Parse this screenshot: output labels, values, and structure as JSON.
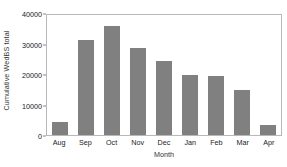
{
  "chart_data": {
    "type": "bar",
    "title": "",
    "xlabel": "Month",
    "ylabel": "Cumulative WedBS total",
    "categories": [
      "Aug",
      "Sep",
      "Oct",
      "Nov",
      "Dec",
      "Jan",
      "Feb",
      "Mar",
      "Apr"
    ],
    "values": [
      4200,
      31000,
      35600,
      28600,
      24200,
      19700,
      19400,
      14700,
      3400
    ],
    "ylim": [
      0,
      40000
    ],
    "yticks": [
      0,
      10000,
      20000,
      30000,
      40000
    ],
    "ytick_labels": [
      "0",
      "10000",
      "20000",
      "30000",
      "40000"
    ],
    "grid": false,
    "legend": false,
    "bar_color": "#808080",
    "frame_color": "#b8b8b8",
    "background": "#ffffff"
  }
}
